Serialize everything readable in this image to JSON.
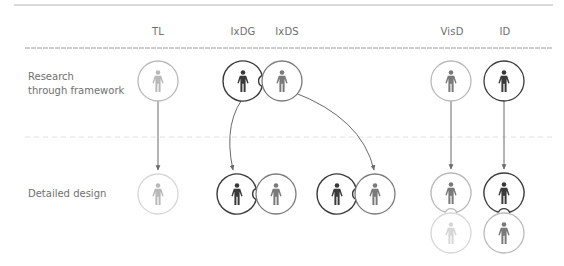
{
  "columns": [
    {
      "id": "tl",
      "label": "TL",
      "x": 158
    },
    {
      "id": "ixdg",
      "label": "IxDG",
      "x": 243
    },
    {
      "id": "ixds",
      "label": "IxDS",
      "x": 287
    },
    {
      "id": "visd",
      "label": "VisD",
      "x": 452
    },
    {
      "id": "id",
      "label": "ID",
      "x": 505
    }
  ],
  "rows": [
    {
      "id": "research",
      "label": "Research\nthrough framework"
    },
    {
      "id": "detailed",
      "label": "Detailed design"
    }
  ],
  "colors": {
    "dark": "#3a3a3a",
    "mid": "#7a7a7a",
    "light": "#b9b9b9",
    "faint": "#d6d6d6",
    "rule": "#9a9a9a",
    "dashed": "#e2e2e2",
    "arrow": "#6a6a6a"
  },
  "nodes": [
    {
      "name": "tl-research",
      "role": "TL",
      "row": "research",
      "cx": 158,
      "cy": 81,
      "ring": "light",
      "figure": "light"
    },
    {
      "name": "ixdg-research",
      "role": "IxDG",
      "row": "research",
      "cx": 243,
      "cy": 81,
      "ring": "dark",
      "figure": "dark",
      "notch": "right"
    },
    {
      "name": "ixds-research",
      "role": "IxDS",
      "row": "research",
      "cx": 282,
      "cy": 81,
      "ring": "mid",
      "figure": "mid"
    },
    {
      "name": "visd-research",
      "role": "VisD",
      "row": "research",
      "cx": 451,
      "cy": 81,
      "ring": "light",
      "figure": "mid"
    },
    {
      "name": "id-research",
      "role": "ID",
      "row": "research",
      "cx": 504,
      "cy": 81,
      "ring": "dark",
      "figure": "dark"
    },
    {
      "name": "tl-detailed",
      "role": "TL",
      "row": "detailed",
      "cx": 158,
      "cy": 194,
      "ring": "faint",
      "figure": "light"
    },
    {
      "name": "ixdg-detailed-a",
      "role": "IxDG",
      "row": "detailed",
      "cx": 237,
      "cy": 194,
      "ring": "dark",
      "figure": "dark",
      "notch": "right"
    },
    {
      "name": "ixds-detailed-a",
      "role": "IxDS",
      "row": "detailed",
      "cx": 276,
      "cy": 194,
      "ring": "mid",
      "figure": "mid"
    },
    {
      "name": "ixdg-detailed-b",
      "role": "IxDG",
      "row": "detailed",
      "cx": 337,
      "cy": 194,
      "ring": "dark",
      "figure": "dark",
      "notch": "right"
    },
    {
      "name": "ixds-detailed-b",
      "role": "IxDS",
      "row": "detailed",
      "cx": 375,
      "cy": 194,
      "ring": "mid",
      "figure": "mid"
    },
    {
      "name": "visd-detailed",
      "role": "VisD",
      "row": "detailed",
      "cx": 451,
      "cy": 193,
      "ring": "light",
      "figure": "mid",
      "notch": "bottom"
    },
    {
      "name": "visd-detailed-support",
      "role": "VisD",
      "row": "detailed",
      "cx": 451,
      "cy": 233,
      "ring": "faint",
      "figure": "faint"
    },
    {
      "name": "id-detailed",
      "role": "ID",
      "row": "detailed",
      "cx": 504,
      "cy": 193,
      "ring": "dark",
      "figure": "dark",
      "notch": "bottom"
    },
    {
      "name": "id-detailed-support",
      "role": "ID",
      "row": "detailed",
      "cx": 504,
      "cy": 233,
      "ring": "light",
      "figure": "mid"
    }
  ],
  "edges": [
    {
      "name": "tl-arrow",
      "from": "tl-research",
      "to": "tl-detailed",
      "d": "M158 101 L158 170",
      "color": "arrow"
    },
    {
      "name": "ixdg-arrow",
      "from": "ixdg-research",
      "to": "ixdg-detailed-a",
      "d": "M248 92 Q 222 120 233 170",
      "color": "arrow"
    },
    {
      "name": "ixds-arrow",
      "from": "ixds-research",
      "to": "ixds-detailed-b",
      "d": "M293 92 Q 362 118 374 170",
      "color": "arrow"
    },
    {
      "name": "visd-arrow",
      "from": "visd-research",
      "to": "visd-detailed",
      "d": "M451 101 L451 169",
      "color": "arrow"
    },
    {
      "name": "id-arrow",
      "from": "id-research",
      "to": "id-detailed",
      "d": "M504 101 L504 169",
      "color": "arrow"
    }
  ],
  "rules": {
    "top": {
      "x1": 14,
      "x2": 553,
      "y": 5
    },
    "header": {
      "x1": 25,
      "x2": 552,
      "y": 48
    },
    "divider": {
      "x1": 25,
      "x2": 552,
      "y": 137
    }
  },
  "geometry": {
    "radius": 20
  }
}
